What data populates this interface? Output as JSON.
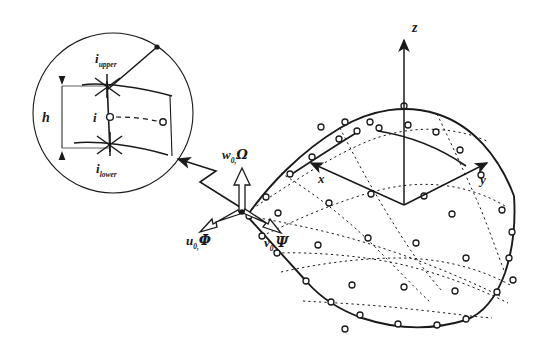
{
  "figure": {
    "kind": "degenerated-shell-element-diagram",
    "background_color": "#ffffff",
    "line_color": "#1a1a1a"
  },
  "detail_circle": {
    "name": "nodal-director-detail",
    "labels": {
      "node_upper": "i",
      "node_upper_sub": "upper",
      "node_mid": "i",
      "node_lower": "i",
      "node_lower_sub": "lower",
      "thickness": "h"
    }
  },
  "dof_triad": {
    "w_symbol": "w",
    "w_sub": "0,",
    "w_rot": "Ω",
    "u_symbol": "u",
    "u_sub": "0,",
    "u_rot": "Φ",
    "v_symbol": "v",
    "v_sub": "0,",
    "v_rot": "Ψ"
  },
  "global_axes": {
    "z": "z",
    "x": "x",
    "y": "y"
  },
  "mesh": {
    "element_count": 4,
    "pattern": "2x2 nine-node quadratic shell elements",
    "node_marker": "open-circle"
  }
}
